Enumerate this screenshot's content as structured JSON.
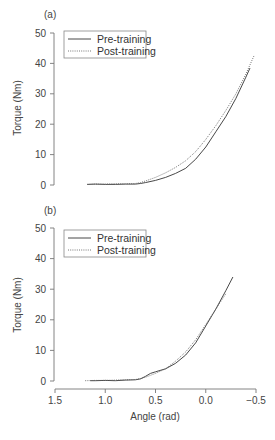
{
  "chart_data": [
    {
      "type": "line",
      "panel": "(a)",
      "title": "",
      "xlabel": "",
      "ylabel": "Torque (Nm)",
      "xlim": [
        1.5,
        -0.5
      ],
      "ylim": [
        0,
        50
      ],
      "xticks": [],
      "yticks": [
        "0",
        "10",
        "20",
        "30",
        "40",
        "50"
      ],
      "grid": false,
      "legend_position": "upper-left",
      "series": [
        {
          "name": "Pre-training",
          "style": "solid",
          "x": [
            1.18,
            1.1,
            1.0,
            0.9,
            0.8,
            0.7,
            0.65,
            0.6,
            0.5,
            0.4,
            0.3,
            0.2,
            0.1,
            0.0,
            -0.1,
            -0.2,
            -0.3,
            -0.4,
            -0.44
          ],
          "y": [
            0.2,
            0.3,
            0.2,
            0.2,
            0.3,
            0.3,
            0.5,
            0.8,
            1.5,
            2.5,
            3.8,
            5.5,
            8.5,
            12.5,
            17.5,
            22.5,
            28.5,
            35.5,
            38.5
          ]
        },
        {
          "name": "Post-training",
          "style": "dotted",
          "x": [
            1.18,
            1.1,
            1.0,
            0.9,
            0.8,
            0.7,
            0.65,
            0.6,
            0.5,
            0.4,
            0.3,
            0.2,
            0.1,
            0.0,
            -0.1,
            -0.2,
            -0.3,
            -0.4,
            -0.48
          ],
          "y": [
            0.2,
            0.3,
            0.3,
            0.4,
            0.4,
            0.5,
            0.8,
            1.3,
            2.5,
            4.0,
            5.8,
            8.0,
            11.0,
            15.0,
            19.5,
            24.5,
            30.0,
            36.5,
            42.5
          ]
        }
      ]
    },
    {
      "type": "line",
      "panel": "(b)",
      "title": "",
      "xlabel": "Angle (rad)",
      "ylabel": "Torque (Nm)",
      "xlim": [
        1.5,
        -0.5
      ],
      "ylim": [
        0,
        50
      ],
      "xticks": [
        "1.5",
        "1.0",
        "0.5",
        "0.0",
        "−0.5"
      ],
      "yticks": [
        "0",
        "10",
        "20",
        "30",
        "40",
        "50"
      ],
      "grid": false,
      "legend_position": "upper-left",
      "series": [
        {
          "name": "Pre-training",
          "style": "solid",
          "x": [
            1.15,
            1.1,
            1.0,
            0.9,
            0.8,
            0.7,
            0.65,
            0.6,
            0.55,
            0.5,
            0.4,
            0.3,
            0.2,
            0.1,
            0.0,
            -0.1,
            -0.2,
            -0.27
          ],
          "y": [
            0.1,
            0.1,
            0.2,
            0.1,
            0.3,
            0.4,
            0.7,
            1.5,
            2.5,
            3.0,
            4.0,
            5.8,
            8.5,
            12.5,
            18.0,
            23.5,
            29.5,
            34.0
          ]
        },
        {
          "name": "Post-training",
          "style": "dotted",
          "x": [
            1.2,
            1.1,
            1.0,
            0.9,
            0.8,
            0.7,
            0.65,
            0.6,
            0.5,
            0.4,
            0.3,
            0.2,
            0.1,
            0.0,
            -0.1,
            -0.2
          ],
          "y": [
            0.1,
            0.2,
            0.2,
            0.3,
            0.4,
            0.5,
            0.8,
            1.2,
            2.5,
            4.0,
            6.5,
            9.5,
            13.5,
            18.5,
            23.5,
            28.5
          ]
        }
      ]
    }
  ],
  "panels": [
    {
      "label": "(a)",
      "legend": [
        "Pre-training",
        "Post-training"
      ],
      "ylabel": "Torque (Nm)"
    },
    {
      "label": "(b)",
      "legend": [
        "Pre-training",
        "Post-training"
      ],
      "ylabel": "Torque (Nm)",
      "xlabel": "Angle (rad)"
    }
  ],
  "colors": {
    "axis": "#777777",
    "pre": "#333333",
    "post": "#666666",
    "text": "#444444"
  }
}
